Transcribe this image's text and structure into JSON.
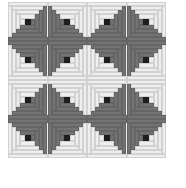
{
  "image": {
    "subject": "log cabin quilt pattern",
    "grid": {
      "rows": 4,
      "cols": 4
    },
    "colors": {
      "dark": "#737373",
      "light": "#eeeeee",
      "center": "#1e1e1e",
      "background": "#ffffff"
    },
    "blocks": [
      [
        "BR",
        "BL",
        "BR",
        "BL"
      ],
      [
        "TR",
        "TL",
        "TR",
        "TL"
      ],
      [
        "BR",
        "BL",
        "BR",
        "BL"
      ],
      [
        "TR",
        "TL",
        "TR",
        "TL"
      ]
    ]
  }
}
